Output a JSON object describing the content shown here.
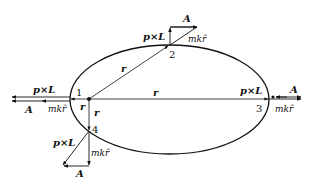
{
  "diagram": {
    "type": "orbit-vector-diagram",
    "ellipse": {
      "cx": 169.5,
      "cy": 99.5,
      "rx": 99.5,
      "ry": 54.5
    },
    "focus": {
      "x": 89,
      "y": 99
    },
    "points": [
      {
        "id": "1",
        "label": "1"
      },
      {
        "id": "2",
        "label": "2"
      },
      {
        "id": "3",
        "label": "3"
      },
      {
        "id": "4",
        "label": "4"
      }
    ],
    "labels": {
      "r": "r",
      "pxL": "p×L",
      "A": "A",
      "mkr": "mkr̂"
    },
    "radius_labels": [
      "r",
      "r",
      "r",
      "r"
    ],
    "vectors": {
      "point1": {
        "pxL": "p×L",
        "A": "A",
        "mkr": "mkr̂"
      },
      "point2": {
        "pxL": "p×L",
        "A": "A",
        "mkr": "mkr̂"
      },
      "point3": {
        "pxL": "p×L",
        "A": "A",
        "mkr": "mkr̂"
      },
      "point4": {
        "pxL": "p×L",
        "A": "A",
        "mkr": "mkr̂"
      }
    }
  }
}
